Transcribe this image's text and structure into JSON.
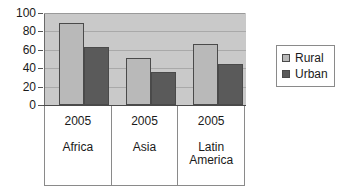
{
  "chart_data": {
    "type": "bar",
    "title": "",
    "subtitle": "",
    "xlabel": "",
    "ylabel": "",
    "categories": [
      "Africa",
      "Asia",
      "Latin America"
    ],
    "category_years": [
      "2005",
      "2005",
      "2005"
    ],
    "series": [
      {
        "name": "Rural",
        "color": "#b9b9b9",
        "values": [
          89,
          51,
          66
        ]
      },
      {
        "name": "Urban",
        "color": "#5a5a5a",
        "values": [
          63,
          36,
          45
        ]
      }
    ],
    "ylim": [
      0,
      100
    ],
    "yticks": [
      0,
      20,
      40,
      60,
      80,
      100
    ],
    "ytick_labels": [
      "0",
      "20",
      "40",
      "60",
      "80",
      "100"
    ],
    "grid": true,
    "legend_position": "right",
    "plot_background": "#c9c9c9"
  },
  "legend": {
    "items": [
      {
        "label": "Rural"
      },
      {
        "label": "Urban"
      }
    ]
  },
  "axis": {
    "ytick_labels": [
      "100",
      "80",
      "60",
      "40",
      "20",
      "0"
    ]
  },
  "categories": [
    {
      "year": "2005",
      "region": "Africa"
    },
    {
      "year": "2005",
      "region": "Asia"
    },
    {
      "year": "2005",
      "region": "Latin America"
    }
  ]
}
